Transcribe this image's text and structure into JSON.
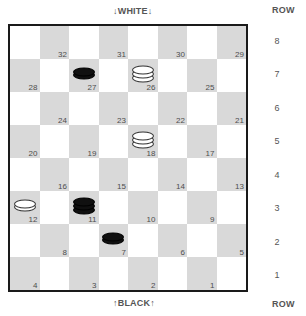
{
  "labels": {
    "top_side": "↓WHITE↓",
    "bottom_side": "↑BLACK↑",
    "row_header_top": "ROW",
    "row_header_bottom": "ROW"
  },
  "row_numbers": [
    "8",
    "7",
    "6",
    "5",
    "4",
    "3",
    "2",
    "1"
  ],
  "colors": {
    "light_square": "#ffffff",
    "dark_square": "#d9d9d9",
    "border": "#1a1a1a",
    "black_piece": "#101010",
    "white_piece": "#ffffff",
    "text": "#4d4d4d"
  },
  "board": {
    "rows": 8,
    "cols": 8,
    "numbered_squares": [
      32,
      31,
      30,
      29,
      28,
      27,
      26,
      25,
      24,
      23,
      22,
      21,
      20,
      19,
      18,
      17,
      16,
      15,
      14,
      13,
      12,
      11,
      10,
      9,
      8,
      7,
      6,
      5,
      4,
      3,
      2,
      1
    ],
    "cells": [
      {
        "row": 8,
        "col": 1,
        "dark": false,
        "num": null,
        "piece": null
      },
      {
        "row": 8,
        "col": 2,
        "dark": true,
        "num": "32",
        "piece": null
      },
      {
        "row": 8,
        "col": 3,
        "dark": false,
        "num": null,
        "piece": null
      },
      {
        "row": 8,
        "col": 4,
        "dark": true,
        "num": "31",
        "piece": null
      },
      {
        "row": 8,
        "col": 5,
        "dark": false,
        "num": null,
        "piece": null
      },
      {
        "row": 8,
        "col": 6,
        "dark": true,
        "num": "30",
        "piece": null
      },
      {
        "row": 8,
        "col": 7,
        "dark": false,
        "num": null,
        "piece": null
      },
      {
        "row": 8,
        "col": 8,
        "dark": true,
        "num": "29",
        "piece": null
      },
      {
        "row": 7,
        "col": 1,
        "dark": true,
        "num": "28",
        "piece": null
      },
      {
        "row": 7,
        "col": 2,
        "dark": false,
        "num": null,
        "piece": null
      },
      {
        "row": 7,
        "col": 3,
        "dark": true,
        "num": "27",
        "piece": {
          "color": "black",
          "rank": "man"
        }
      },
      {
        "row": 7,
        "col": 4,
        "dark": false,
        "num": null,
        "piece": null
      },
      {
        "row": 7,
        "col": 5,
        "dark": true,
        "num": "26",
        "piece": {
          "color": "white",
          "rank": "king"
        }
      },
      {
        "row": 7,
        "col": 6,
        "dark": false,
        "num": null,
        "piece": null
      },
      {
        "row": 7,
        "col": 7,
        "dark": true,
        "num": "25",
        "piece": null
      },
      {
        "row": 7,
        "col": 8,
        "dark": false,
        "num": null,
        "piece": null
      },
      {
        "row": 6,
        "col": 1,
        "dark": false,
        "num": null,
        "piece": null
      },
      {
        "row": 6,
        "col": 2,
        "dark": true,
        "num": "24",
        "piece": null
      },
      {
        "row": 6,
        "col": 3,
        "dark": false,
        "num": null,
        "piece": null
      },
      {
        "row": 6,
        "col": 4,
        "dark": true,
        "num": "23",
        "piece": null
      },
      {
        "row": 6,
        "col": 5,
        "dark": false,
        "num": null,
        "piece": null
      },
      {
        "row": 6,
        "col": 6,
        "dark": true,
        "num": "22",
        "piece": null
      },
      {
        "row": 6,
        "col": 7,
        "dark": false,
        "num": null,
        "piece": null
      },
      {
        "row": 6,
        "col": 8,
        "dark": true,
        "num": "21",
        "piece": null
      },
      {
        "row": 5,
        "col": 1,
        "dark": true,
        "num": "20",
        "piece": null
      },
      {
        "row": 5,
        "col": 2,
        "dark": false,
        "num": null,
        "piece": null
      },
      {
        "row": 5,
        "col": 3,
        "dark": true,
        "num": "19",
        "piece": null
      },
      {
        "row": 5,
        "col": 4,
        "dark": false,
        "num": null,
        "piece": null
      },
      {
        "row": 5,
        "col": 5,
        "dark": true,
        "num": "18",
        "piece": {
          "color": "white",
          "rank": "king"
        }
      },
      {
        "row": 5,
        "col": 6,
        "dark": false,
        "num": null,
        "piece": null
      },
      {
        "row": 5,
        "col": 7,
        "dark": true,
        "num": "17",
        "piece": null
      },
      {
        "row": 5,
        "col": 8,
        "dark": false,
        "num": null,
        "piece": null
      },
      {
        "row": 4,
        "col": 1,
        "dark": false,
        "num": null,
        "piece": null
      },
      {
        "row": 4,
        "col": 2,
        "dark": true,
        "num": "16",
        "piece": null
      },
      {
        "row": 4,
        "col": 3,
        "dark": false,
        "num": null,
        "piece": null
      },
      {
        "row": 4,
        "col": 4,
        "dark": true,
        "num": "15",
        "piece": null
      },
      {
        "row": 4,
        "col": 5,
        "dark": false,
        "num": null,
        "piece": null
      },
      {
        "row": 4,
        "col": 6,
        "dark": true,
        "num": "14",
        "piece": null
      },
      {
        "row": 4,
        "col": 7,
        "dark": false,
        "num": null,
        "piece": null
      },
      {
        "row": 4,
        "col": 8,
        "dark": true,
        "num": "13",
        "piece": null
      },
      {
        "row": 3,
        "col": 1,
        "dark": true,
        "num": "12",
        "piece": {
          "color": "white",
          "rank": "man"
        }
      },
      {
        "row": 3,
        "col": 2,
        "dark": false,
        "num": null,
        "piece": null
      },
      {
        "row": 3,
        "col": 3,
        "dark": true,
        "num": "11",
        "piece": {
          "color": "black",
          "rank": "king"
        }
      },
      {
        "row": 3,
        "col": 4,
        "dark": false,
        "num": null,
        "piece": null
      },
      {
        "row": 3,
        "col": 5,
        "dark": true,
        "num": "10",
        "piece": null
      },
      {
        "row": 3,
        "col": 6,
        "dark": false,
        "num": null,
        "piece": null
      },
      {
        "row": 3,
        "col": 7,
        "dark": true,
        "num": "9",
        "piece": null
      },
      {
        "row": 3,
        "col": 8,
        "dark": false,
        "num": null,
        "piece": null
      },
      {
        "row": 2,
        "col": 1,
        "dark": false,
        "num": null,
        "piece": null
      },
      {
        "row": 2,
        "col": 2,
        "dark": true,
        "num": "8",
        "piece": null
      },
      {
        "row": 2,
        "col": 3,
        "dark": false,
        "num": null,
        "piece": null
      },
      {
        "row": 2,
        "col": 4,
        "dark": true,
        "num": "7",
        "piece": {
          "color": "black",
          "rank": "man"
        }
      },
      {
        "row": 2,
        "col": 5,
        "dark": false,
        "num": null,
        "piece": null
      },
      {
        "row": 2,
        "col": 6,
        "dark": true,
        "num": "6",
        "piece": null
      },
      {
        "row": 2,
        "col": 7,
        "dark": false,
        "num": null,
        "piece": null
      },
      {
        "row": 2,
        "col": 8,
        "dark": true,
        "num": "5",
        "piece": null
      },
      {
        "row": 1,
        "col": 1,
        "dark": true,
        "num": "4",
        "piece": null
      },
      {
        "row": 1,
        "col": 2,
        "dark": false,
        "num": null,
        "piece": null
      },
      {
        "row": 1,
        "col": 3,
        "dark": true,
        "num": "3",
        "piece": null
      },
      {
        "row": 1,
        "col": 4,
        "dark": false,
        "num": null,
        "piece": null
      },
      {
        "row": 1,
        "col": 5,
        "dark": true,
        "num": "2",
        "piece": null
      },
      {
        "row": 1,
        "col": 6,
        "dark": false,
        "num": null,
        "piece": null
      },
      {
        "row": 1,
        "col": 7,
        "dark": true,
        "num": "1",
        "piece": null
      },
      {
        "row": 1,
        "col": 8,
        "dark": false,
        "num": null,
        "piece": null
      }
    ],
    "pieces_summary": [
      {
        "square": "27",
        "color": "black",
        "rank": "man"
      },
      {
        "square": "26",
        "color": "white",
        "rank": "king"
      },
      {
        "square": "18",
        "color": "white",
        "rank": "king"
      },
      {
        "square": "12",
        "color": "white",
        "rank": "man"
      },
      {
        "square": "11",
        "color": "black",
        "rank": "king"
      },
      {
        "square": "7",
        "color": "black",
        "rank": "man"
      }
    ]
  }
}
